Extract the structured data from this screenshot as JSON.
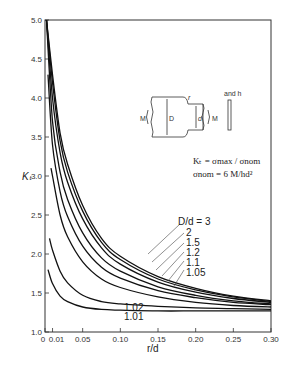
{
  "chart_data": {
    "type": "line",
    "title": "",
    "xlabel": "r/d",
    "ylabel": "Kₜ",
    "xlim": [
      0,
      0.3
    ],
    "ylim": [
      1.0,
      5.0
    ],
    "grid": false,
    "x_ticks": [
      "0",
      "0.01",
      "0.05",
      "0.10",
      "0.15",
      "0.20",
      "0.25",
      "0.30"
    ],
    "y_ticks": [
      "1.0",
      "1.5",
      "2.0",
      "2.5",
      "3.0",
      "3.5",
      "4.0",
      "4.5",
      "5.0"
    ],
    "legend_title": "D/d = 3",
    "series": [
      {
        "name": "D/d = 3",
        "x": [
          0.002,
          0.01,
          0.02,
          0.03,
          0.05,
          0.075,
          0.1,
          0.15,
          0.2,
          0.25,
          0.3
        ],
        "y": [
          5.0,
          4.3,
          3.55,
          3.15,
          2.62,
          2.2,
          1.97,
          1.71,
          1.56,
          1.46,
          1.4
        ]
      },
      {
        "name": "D/d = 2",
        "x": [
          0.002,
          0.01,
          0.02,
          0.03,
          0.05,
          0.075,
          0.1,
          0.15,
          0.2,
          0.25,
          0.3
        ],
        "y": [
          5.0,
          4.2,
          3.45,
          3.05,
          2.55,
          2.15,
          1.93,
          1.68,
          1.54,
          1.45,
          1.39
        ]
      },
      {
        "name": "D/d = 1.5",
        "x": [
          0.002,
          0.01,
          0.02,
          0.03,
          0.05,
          0.075,
          0.1,
          0.15,
          0.2,
          0.25,
          0.3
        ],
        "y": [
          5.0,
          4.0,
          3.3,
          2.92,
          2.45,
          2.08,
          1.87,
          1.64,
          1.51,
          1.43,
          1.38
        ]
      },
      {
        "name": "D/d = 1.2",
        "x": [
          0.002,
          0.01,
          0.02,
          0.03,
          0.05,
          0.075,
          0.1,
          0.15,
          0.2,
          0.25,
          0.3
        ],
        "y": [
          5.0,
          3.7,
          3.05,
          2.7,
          2.27,
          1.95,
          1.78,
          1.58,
          1.47,
          1.4,
          1.36
        ]
      },
      {
        "name": "D/d = 1.1",
        "x": [
          0.004,
          0.01,
          0.02,
          0.03,
          0.05,
          0.075,
          0.1,
          0.15,
          0.2,
          0.25,
          0.3
        ],
        "y": [
          4.3,
          3.4,
          2.8,
          2.48,
          2.1,
          1.83,
          1.69,
          1.53,
          1.44,
          1.38,
          1.35
        ]
      },
      {
        "name": "D/d = 1.05",
        "x": [
          0.008,
          0.01,
          0.02,
          0.03,
          0.05,
          0.075,
          0.1,
          0.15,
          0.2,
          0.25,
          0.3
        ],
        "y": [
          3.1,
          3.0,
          2.5,
          2.22,
          1.9,
          1.68,
          1.57,
          1.45,
          1.38,
          1.34,
          1.32
        ]
      },
      {
        "name": "D/d = 1.02",
        "x": [
          0.006,
          0.01,
          0.02,
          0.03,
          0.05,
          0.075,
          0.1,
          0.15,
          0.2,
          0.25,
          0.3
        ],
        "y": [
          2.2,
          2.05,
          1.78,
          1.63,
          1.47,
          1.39,
          1.36,
          1.33,
          1.31,
          1.3,
          1.29
        ]
      },
      {
        "name": "D/d = 1.01",
        "x": [
          0.004,
          0.01,
          0.02,
          0.03,
          0.05,
          0.075,
          0.1,
          0.15,
          0.2,
          0.25,
          0.3
        ],
        "y": [
          1.8,
          1.62,
          1.46,
          1.39,
          1.32,
          1.29,
          1.28,
          1.27,
          1.27,
          1.27,
          1.27
        ]
      }
    ],
    "annotations": [
      "Kₜ = σmax / σnom",
      "σnom = 6 M/hd²"
    ]
  },
  "axes": {
    "xlabel": "r/d",
    "ylabel": "Kₜ",
    "x_tick_labels": [
      "0",
      "0.01",
      "0.05",
      "0.10",
      "0.15",
      "0.20",
      "0.25",
      "0.30"
    ],
    "y_tick_labels": [
      "1.0",
      "1.5",
      "2.0",
      "2.5",
      "3.0",
      "3.5",
      "4.0",
      "4.5",
      "5.0"
    ]
  },
  "legend": {
    "labels": [
      "D/d = 3",
      "2",
      "1.5",
      "1.2",
      "1.1",
      "1.05"
    ],
    "low_labels": [
      "1.02",
      "1.01"
    ]
  },
  "inset": {
    "moment_left": "M",
    "moment_right": "M",
    "big_dim": "D",
    "small_dim": "d",
    "radius": "r",
    "thickness_note": "and h",
    "formula1": "Kₜ = σmax / σnom",
    "formula2": "σnom = 6 M/hd²"
  }
}
